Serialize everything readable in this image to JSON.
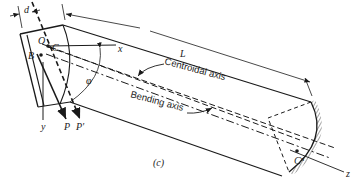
{
  "figure": {
    "caption": "(c)",
    "labels": {
      "d": "d",
      "O": "O",
      "C": "C",
      "x": "x",
      "B": "B",
      "L": "L",
      "phi": "φ",
      "y": "y",
      "P": "P",
      "P_prime": "P′",
      "C_n": "Cⁿ",
      "z": "z"
    },
    "annotations": {
      "centroidal_axis": "Centroidal axis",
      "bending_axis": "Bending axis"
    },
    "colors": {
      "ink": "#1a1a1a",
      "background": "#ffffff"
    }
  }
}
